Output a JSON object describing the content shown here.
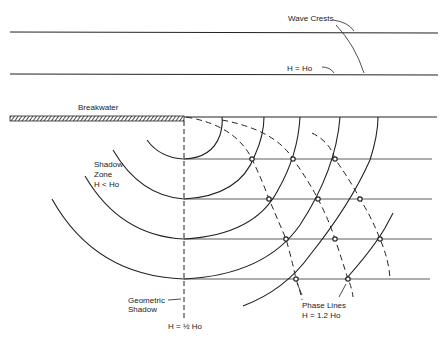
{
  "diagram": {
    "labels": {
      "wave_crests": "Wave Crests",
      "h_equals_ho": "H = Ho",
      "breakwater": "Breakwater",
      "shadow_zone_line1": "Shadow",
      "shadow_zone_line2": "Zone",
      "shadow_zone_line3": "H < Ho",
      "geometric_shadow_line1": "Geometric",
      "geometric_shadow_line2": "Shadow",
      "h_half_ho": "H = ½ Ho",
      "phase_lines_line1": "Phase Lines",
      "phase_lines_line2": "H = 1.2 Ho"
    },
    "colors": {
      "ink": "#222222",
      "background": "#ffffff"
    },
    "elements": {
      "incident_crest_lines": 2,
      "diffracted_crest_arcs": 6,
      "phase_lines_dashed": 3,
      "horizontal_reference_lines": 4,
      "marked_intersections": 11
    }
  }
}
